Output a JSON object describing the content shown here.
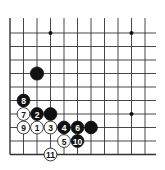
{
  "diagram": {
    "type": "go-board-corner",
    "corner": "bottom-left",
    "columns_shown": 11,
    "rows_shown": 10,
    "colors": {
      "black": "#111111",
      "white": "#ffffff",
      "line": "#333333"
    },
    "star_points": [
      {
        "col": 4,
        "row": 10
      },
      {
        "col": 10,
        "row": 10
      },
      {
        "col": 10,
        "row": 4
      }
    ],
    "stones": [
      {
        "color": "black",
        "col": 3,
        "row": 7,
        "label": ""
      },
      {
        "color": "black",
        "col": 2,
        "row": 5,
        "label": "8"
      },
      {
        "color": "white",
        "col": 2,
        "row": 4,
        "label": "7"
      },
      {
        "color": "black",
        "col": 3,
        "row": 4,
        "label": "2"
      },
      {
        "color": "black",
        "col": 4,
        "row": 4,
        "label": ""
      },
      {
        "color": "white",
        "col": 2,
        "row": 3,
        "label": "9"
      },
      {
        "color": "white",
        "col": 3,
        "row": 3,
        "label": "1"
      },
      {
        "color": "white",
        "col": 4,
        "row": 3,
        "label": "3"
      },
      {
        "color": "black",
        "col": 5,
        "row": 3,
        "label": "4"
      },
      {
        "color": "black",
        "col": 6,
        "row": 3,
        "label": "6"
      },
      {
        "color": "black",
        "col": 7,
        "row": 3,
        "label": ""
      },
      {
        "color": "white",
        "col": 5,
        "row": 2,
        "label": "5"
      },
      {
        "color": "black",
        "col": 6,
        "row": 2,
        "label": "10"
      },
      {
        "color": "white",
        "col": 4,
        "row": 1,
        "label": "11"
      }
    ]
  }
}
